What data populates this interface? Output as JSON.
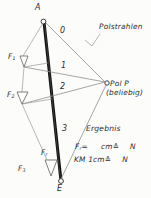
{
  "diagram": {
    "title_note": "Polstrahlen",
    "points": {
      "top": "A",
      "bottom": "E",
      "pole": "Pol P",
      "pole_note": "(beliebig)"
    },
    "rays": [
      "0",
      "1",
      "2",
      "3"
    ],
    "forces": {
      "f1": "F",
      "f1_sub": "1",
      "f2": "F",
      "f2_sub": "2",
      "f3": "F",
      "f3_sub": "3",
      "fr": "F",
      "fr_sub": "r"
    },
    "results": {
      "heading": "Ergebnis",
      "line1_left": "F",
      "line1_sub": "r",
      "line1_eq": "=",
      "line1_unit": "cm",
      "line1_corresponds": "≙",
      "line1_newton": "N",
      "line2_left": "KM 1cm",
      "line2_corresponds": "≙",
      "line2_newton": "N"
    },
    "colors": {
      "ink": "#2b2b2b",
      "ray": "#8c8c8c",
      "load_line": "#111111",
      "paper": "#fcfcfb"
    }
  }
}
